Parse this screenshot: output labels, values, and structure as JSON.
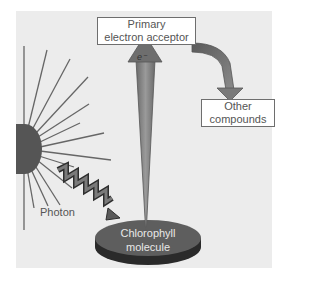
{
  "diagram": {
    "primary_acceptor": {
      "line1": "Primary",
      "line2": "electron acceptor"
    },
    "other_compounds": {
      "line1": "Other",
      "line2": "compounds"
    },
    "photon_label": "Photon",
    "chlorophyll": {
      "line1": "Chlorophyll",
      "line2": "molecule"
    },
    "electron_label": "e⁻"
  },
  "colors": {
    "panel": "#ececec",
    "sun": "#555555",
    "rays": "#666666",
    "arrow": "#7a7a7a",
    "disc_top": "#5e5e5e",
    "disc_side": "#2a2a2a"
  }
}
